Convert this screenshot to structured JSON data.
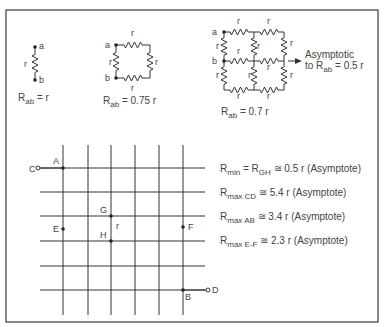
{
  "figure": {
    "single": {
      "node_a": "a",
      "node_b": "b",
      "resistor": "r",
      "eq_prefix": "R",
      "eq_sub": "ab",
      "eq_rest": " = r"
    },
    "square": {
      "node_a": "a",
      "node_b": "b",
      "resistor": "r",
      "eq_prefix": "R",
      "eq_sub": "ab",
      "eq_rest": " = 0.75 r"
    },
    "grid2x2": {
      "node_a": "a",
      "node_b": "b",
      "resistor": "r",
      "eq_prefix": "R",
      "eq_sub": "ab",
      "eq_rest": " = 0.7 r",
      "note_line1": "Asymptotic",
      "note_line2_prefix": "to R",
      "note_line2_sub": "ab",
      "note_line2_rest": " = 0.5 r"
    },
    "infinite_grid": {
      "nodes": {
        "A": "A",
        "B": "B",
        "C": "C",
        "D": "D",
        "E": "E",
        "F": "F",
        "G": "G",
        "H": "H"
      },
      "resistor": "r"
    },
    "results": [
      {
        "prefix": "R",
        "sub": "min",
        "mid_prefix": " = R",
        "mid_sub": "GH",
        "rest": " ≅ 0.5 r (Asymptote)"
      },
      {
        "prefix": "R",
        "sub": "max CD",
        "mid_prefix": "",
        "mid_sub": "",
        "rest": " ≅ 5.4 r (Asymptote)"
      },
      {
        "prefix": "R",
        "sub": "max AB",
        "mid_prefix": "",
        "mid_sub": "",
        "rest": " ≅ 3.4 r (Asymptote)"
      },
      {
        "prefix": "R",
        "sub": "max E-F",
        "mid_prefix": "",
        "mid_sub": "",
        "rest": " ≅ 2.3 r (Asymptote)"
      }
    ]
  }
}
